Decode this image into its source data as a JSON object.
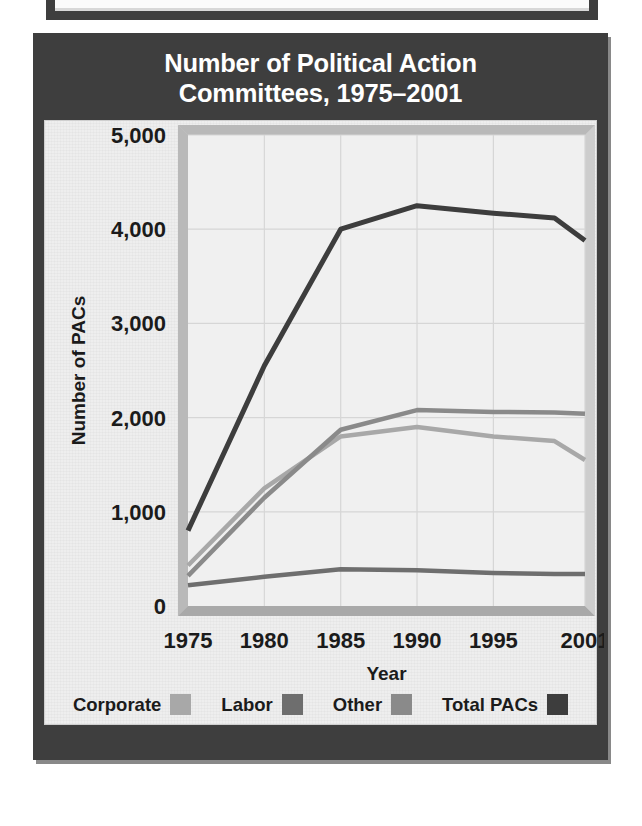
{
  "figure": {
    "title_line1": "Number of Political Action",
    "title_line2": "Committees, 1975–2001",
    "title_full": "Number of Political Action Committees, 1975–2001"
  },
  "colors": {
    "panel_border": "#3e3e3e",
    "panel_background": "#eeeeee",
    "plot_background": "#f0f0f0",
    "title_text": "#ffffff",
    "axis_text": "#1b1b1b",
    "gridline": "#d6d6d6",
    "corporate": "#a8a8a8",
    "labor": "#6e6e6e",
    "other": "#8a8a8a",
    "total_pacs": "#3d3d3d"
  },
  "chart_data": {
    "type": "line",
    "title": "Number of Political Action Committees, 1975–2001",
    "xlabel": "Year",
    "ylabel": "Number of PACs",
    "x": [
      1975,
      1980,
      1985,
      1990,
      1995,
      1999,
      2001
    ],
    "xtick_labels": [
      "1975",
      "1980",
      "1985",
      "1990",
      "1995",
      "2001"
    ],
    "xtick_values": [
      1975,
      1980,
      1985,
      1990,
      1995,
      2001
    ],
    "xlim": [
      1975,
      2001
    ],
    "ytick_labels": [
      "0",
      "1,000",
      "2,000",
      "3,000",
      "4,000",
      "5,000"
    ],
    "ytick_values": [
      0,
      1000,
      2000,
      3000,
      4000,
      5000
    ],
    "ylim": [
      0,
      5000
    ],
    "grid": true,
    "legend_position": "bottom",
    "series": [
      {
        "name": "Corporate",
        "color": "#a8a8a8",
        "values": [
          430,
          1250,
          1800,
          1900,
          1800,
          1750,
          1550
        ]
      },
      {
        "name": "Labor",
        "color": "#6e6e6e",
        "values": [
          220,
          310,
          390,
          380,
          350,
          340,
          340
        ]
      },
      {
        "name": "Other",
        "color": "#8a8a8a",
        "values": [
          320,
          1150,
          1870,
          2080,
          2060,
          2055,
          2040
        ]
      },
      {
        "name": "Total PACs",
        "color": "#3d3d3d",
        "values": [
          800,
          2550,
          4000,
          4250,
          4170,
          4120,
          3880
        ]
      }
    ]
  },
  "legend": {
    "items": [
      {
        "label": "Corporate",
        "color": "#a8a8a8"
      },
      {
        "label": "Labor",
        "color": "#6e6e6e"
      },
      {
        "label": "Other",
        "color": "#8a8a8a"
      },
      {
        "label": "Total PACs",
        "color": "#3d3d3d"
      }
    ]
  }
}
